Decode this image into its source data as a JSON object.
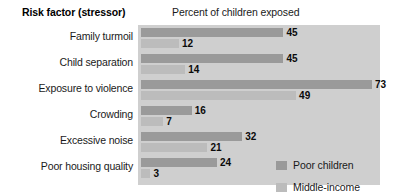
{
  "header": {
    "risk_factor_heading": "Risk factor (stressor)",
    "chart_title": "Percent of children exposed"
  },
  "legend": {
    "entries": [
      {
        "label": "Poor children",
        "color": "#9a9a9a"
      },
      {
        "label": "Middle-income children",
        "line1": "Middle-income",
        "line2": "children",
        "color": "#bcbcbc"
      }
    ]
  },
  "colors": {
    "plot_background": "#cfcfcf",
    "page_background": "#ffffff",
    "poor_children_bar": "#9a9a9a",
    "middle_income_bar": "#bcbcbc",
    "text": "#1a1a1a"
  },
  "chart_data": {
    "type": "bar",
    "orientation": "horizontal",
    "title": "Percent of children exposed",
    "xlabel": "",
    "ylabel": "Risk factor (stressor)",
    "xlim": [
      0,
      76
    ],
    "grid": false,
    "legend_position": "inside-bottom-right",
    "categories": [
      "Family turmoil",
      "Child separation",
      "Exposure to violence",
      "Crowding",
      "Excessive noise",
      "Poor housing quality"
    ],
    "series": [
      {
        "name": "Poor children",
        "color": "#9a9a9a",
        "values": [
          45,
          45,
          73,
          16,
          32,
          24
        ],
        "value_labels": [
          "45",
          "45",
          "73",
          "16",
          "32",
          "24"
        ]
      },
      {
        "name": "Middle-income children",
        "color": "#bcbcbc",
        "values": [
          12,
          14,
          49,
          7,
          21,
          3
        ],
        "value_labels": [
          "12",
          "14",
          "49",
          "7",
          "21",
          "3"
        ]
      }
    ]
  }
}
